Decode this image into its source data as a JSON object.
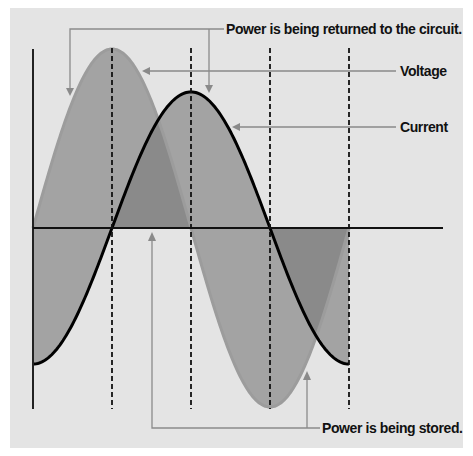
{
  "diagram": {
    "labels": {
      "returned": "Power is being returned to the circuit.",
      "voltage": "Voltage",
      "current": "Current",
      "stored": "Power is being stored."
    },
    "colors": {
      "panel": "#e4e4e4",
      "fill": "#7a7a7a",
      "voltage_curve": "#9c9c9c",
      "current_curve": "#000000",
      "axis": "#111111",
      "callout": "#8a8a8a"
    }
  },
  "chart_data": {
    "type": "line",
    "title": "",
    "xlabel": "",
    "ylabel": "",
    "x_quarter_periods": [
      0,
      0.25,
      0.5,
      0.75,
      1.0
    ],
    "series": [
      {
        "name": "Voltage",
        "function": "sin",
        "amplitude": 1.0,
        "values": [
          0,
          1,
          0,
          -1,
          0
        ]
      },
      {
        "name": "Current",
        "function": "-cos",
        "amplitude": 0.76,
        "values": [
          -0.76,
          0,
          0.76,
          0,
          -0.76
        ]
      }
    ],
    "phase_shift_deg": 90,
    "dashed_markers_at": [
      0.25,
      0.5,
      0.75,
      1.0
    ],
    "annotations": [
      "Power is being returned to the circuit.",
      "Power is being stored."
    ],
    "grid": false
  }
}
